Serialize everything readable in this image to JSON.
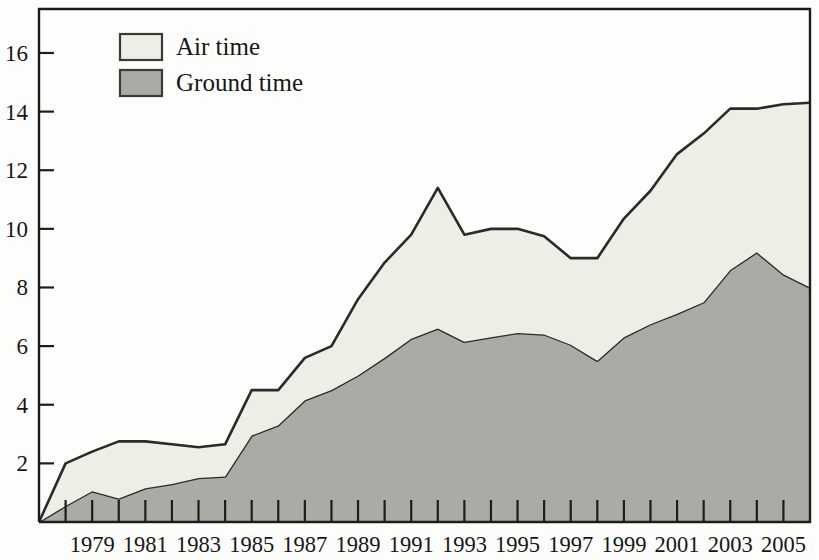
{
  "chart_data": {
    "type": "area",
    "stacked": true,
    "title": "",
    "subtitle": "",
    "xlabel": "",
    "ylabel": "",
    "grid": false,
    "legend_position": "top-left",
    "x": [
      1977,
      1978,
      1979,
      1980,
      1981,
      1982,
      1983,
      1984,
      1985,
      1986,
      1987,
      1988,
      1989,
      1990,
      1991,
      1992,
      1993,
      1994,
      1995,
      1996,
      1997,
      1998,
      1999,
      2000,
      2001,
      2002,
      2003,
      2004,
      2005,
      2006
    ],
    "xlim": [
      1977,
      2006
    ],
    "ylim": [
      0,
      17.5
    ],
    "yticks": [
      2,
      4,
      6,
      8,
      10,
      12,
      14,
      16
    ],
    "ytick_labels": [
      "2",
      "4",
      "6",
      "8",
      "10",
      "12",
      "14",
      "16"
    ],
    "xtick_labels": [
      "1979",
      "1981",
      "1983",
      "1985",
      "1987",
      "1989",
      "1991",
      "1993",
      "1995",
      "1997",
      "1999",
      "2001",
      "2003",
      "2005"
    ],
    "xtick_label_years": [
      1979,
      1981,
      1983,
      1985,
      1987,
      1989,
      1991,
      1993,
      1995,
      1997,
      1999,
      2001,
      2003,
      2005
    ],
    "series": [
      {
        "name": "Ground time",
        "color": "#ABABA6",
        "values": [
          0.0,
          0.55,
          1.05,
          0.8,
          1.15,
          1.3,
          1.5,
          1.55,
          2.95,
          3.3,
          4.15,
          4.5,
          5.0,
          5.6,
          6.25,
          6.6,
          6.15,
          6.3,
          6.45,
          6.4,
          6.05,
          5.5,
          6.3,
          6.75,
          7.1,
          7.5,
          8.6,
          9.2,
          8.45,
          8.0
        ]
      },
      {
        "name": "Air time",
        "color": "#EEEEE6",
        "values": [
          0.0,
          1.45,
          1.35,
          1.95,
          1.6,
          1.35,
          1.05,
          1.1,
          1.55,
          1.2,
          1.45,
          1.5,
          2.6,
          3.25,
          3.55,
          4.8,
          3.65,
          3.7,
          3.55,
          3.35,
          2.95,
          3.5,
          4.05,
          4.55,
          5.45,
          5.75,
          5.5,
          4.9,
          5.8,
          6.3
        ]
      }
    ],
    "totals": [
      0.0,
      2.0,
      2.4,
      2.75,
      2.75,
      2.65,
      2.55,
      2.65,
      4.5,
      4.5,
      5.6,
      6.0,
      7.6,
      8.85,
      9.8,
      11.4,
      9.8,
      10.0,
      10.0,
      9.75,
      9.0,
      9.0,
      10.35,
      11.3,
      12.55,
      13.25,
      14.1,
      14.1,
      14.25,
      14.3
    ]
  },
  "legend": {
    "items": [
      {
        "label": "Air time",
        "swatch_color": "#EEEEE6",
        "swatch_border": "#3a3a38"
      },
      {
        "label": "Ground time",
        "swatch_color": "#ABABA6",
        "swatch_border": "#3a3a38"
      }
    ]
  },
  "axes": {
    "y_tick_labels": [
      "16",
      "14",
      "12",
      "10",
      "8",
      "6",
      "4",
      "2"
    ],
    "x_tick_labels": [
      "1979",
      "1981",
      "1983",
      "1985",
      "1987",
      "1989",
      "1991",
      "1993",
      "1995",
      "1997",
      "1999",
      "2001",
      "2003",
      "2005"
    ]
  },
  "colors": {
    "air_time_fill": "#EEEEE6",
    "ground_time_fill": "#ABABA6",
    "outline": "#2a2a28",
    "frame": "#1d1d1d",
    "background": "#fdfdfc",
    "text": "#161616"
  }
}
